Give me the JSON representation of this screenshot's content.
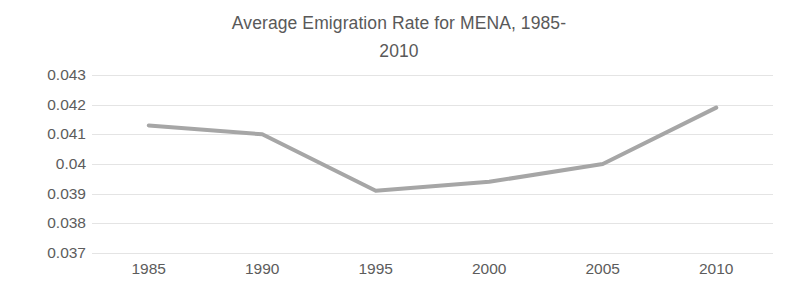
{
  "chart_data": {
    "type": "line",
    "title": "Average Emigration Rate for MENA, 1985-\n2010",
    "title_line1": "Average Emigration Rate for MENA, 1985-",
    "title_line2": "2010",
    "xlabel": "",
    "ylabel": "",
    "categories": [
      "1985",
      "1990",
      "1995",
      "2000",
      "2005",
      "2010"
    ],
    "values": [
      0.0413,
      0.041,
      0.0391,
      0.0394,
      0.04,
      0.0419
    ],
    "series": [
      {
        "name": "Average Emigration Rate",
        "values": [
          0.0413,
          0.041,
          0.0391,
          0.0394,
          0.04,
          0.0419
        ]
      }
    ],
    "ylim": [
      0.037,
      0.043
    ],
    "ytick_step": 0.001,
    "ytick_labels": [
      "0.043",
      "0.042",
      "0.041",
      "0.04",
      "0.039",
      "0.038",
      "0.037"
    ],
    "ytick_values": [
      0.043,
      0.042,
      0.041,
      0.04,
      0.039,
      0.038,
      0.037
    ],
    "xtick_labels": [
      "1985",
      "1990",
      "1995",
      "2000",
      "2005",
      "2010"
    ],
    "grid": {
      "horizontal": true,
      "vertical": false
    },
    "legend": {
      "visible": false,
      "position": "none"
    },
    "markers": false,
    "colors": {
      "line": "#a6a6a6",
      "grid": "#e4e4e4",
      "title_text": "#595959",
      "tick_text": "#5c5c5c",
      "background": "#ffffff"
    },
    "line_width_px": 4
  }
}
